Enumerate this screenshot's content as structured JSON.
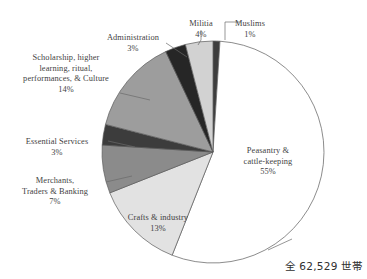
{
  "figure": {
    "total_note": "全 62,529 世帯",
    "background": "#ffffff",
    "text_color": "#3f3f3f"
  },
  "chart_data": {
    "type": "pie",
    "title": "",
    "subtitle": "",
    "xlabel": "",
    "ylabel": "",
    "grid": false,
    "legend_position": "none",
    "labels_outside": true,
    "start_angle_deg": 0,
    "direction": "clockwise",
    "total_label": "全 62,529 世帯",
    "total_value": 62529,
    "total_unit": "世帯",
    "categories": [
      "Muslims",
      "Peasantry & cattle-keeping",
      "Crafts & industry",
      "Merchants, Traders & Banking",
      "Essential Services",
      "Scholarship, higher learning, ritual, performances, & Culture",
      "Administration",
      "Militia"
    ],
    "values": [
      1,
      55,
      13,
      7,
      3,
      14,
      3,
      4
    ],
    "value_labels": [
      "1%",
      "55%",
      "13%",
      "7%",
      "3%",
      "14%",
      "3%",
      "4%"
    ],
    "colors": [
      "#3d3d3d",
      "#ffffff",
      "#e2e2e2",
      "#8b8b8b",
      "#3c3c3c",
      "#9d9d9d",
      "#262626",
      "#d2d2d2"
    ],
    "slice_border": "#5a5a5a",
    "slices": [
      {
        "label": "Muslims",
        "value": 1,
        "value_label": "1%",
        "color": "#3d3d3d"
      },
      {
        "label": "Peasantry & cattle-keeping",
        "value": 55,
        "value_label": "55%",
        "color": "#ffffff"
      },
      {
        "label": "Crafts & industry",
        "value": 13,
        "value_label": "13%",
        "color": "#e2e2e2"
      },
      {
        "label": "Merchants, Traders & Banking",
        "value": 7,
        "value_label": "7%",
        "color": "#8b8b8b"
      },
      {
        "label": "Essential Services",
        "value": 3,
        "value_label": "3%",
        "color": "#3c3c3c"
      },
      {
        "label": "Scholarship, higher learning, ritual, performances, & Culture",
        "value": 14,
        "value_label": "14%",
        "color": "#9d9d9d"
      },
      {
        "label": "Administration",
        "value": 3,
        "value_label": "3%",
        "color": "#262626"
      },
      {
        "label": "Militia",
        "value": 4,
        "value_label": "4%",
        "color": "#d2d2d2"
      }
    ]
  },
  "callouts": {
    "muslims": {
      "name": "Muslims",
      "pct": "1%"
    },
    "militia": {
      "name": "Militia",
      "pct": "4%"
    },
    "administration": {
      "name": "Administration",
      "pct": "3%"
    },
    "scholarship": {
      "name": "Scholarship, higher\nlearning, ritual,\nperformances, & Culture",
      "pct": "14%"
    },
    "essential_services": {
      "name": "Essential Services",
      "pct": "3%"
    },
    "merchants": {
      "name": "Merchants,\nTraders & Banking",
      "pct": "7%"
    },
    "crafts": {
      "name": "Crafts & industry",
      "pct": "13%"
    },
    "peasantry": {
      "name": "Peasantry &\ncattle-keeping",
      "pct": "55%"
    }
  }
}
